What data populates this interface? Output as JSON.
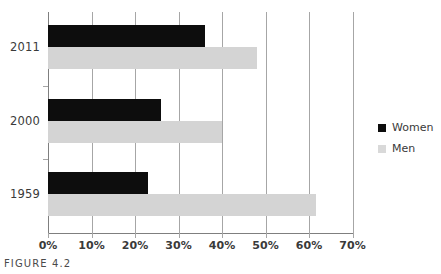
{
  "caption": "FIGURE 4.2",
  "legend": {
    "position": "right",
    "items": [
      {
        "label": "Women",
        "color": "#0d0d0d",
        "swatch": "women-swatch"
      },
      {
        "label": "Men",
        "color": "#d9d9d9",
        "swatch": "men-swatch"
      }
    ]
  },
  "axis": {
    "x_ticks": [
      "0%",
      "10%",
      "20%",
      "30%",
      "40%",
      "50%",
      "60%",
      "70%"
    ],
    "y_ticks": [
      "2011",
      "2000",
      "1959"
    ]
  },
  "chart_data": {
    "type": "bar",
    "orientation": "horizontal",
    "title": "",
    "subtitle": "",
    "xlabel": "",
    "ylabel": "",
    "categories": [
      "2011",
      "2000",
      "1959"
    ],
    "series": [
      {
        "name": "Women",
        "color": "#0d0d0d",
        "values": [
          36,
          26,
          23
        ]
      },
      {
        "name": "Men",
        "color": "#d4d4d4",
        "values": [
          48,
          40,
          61.5
        ]
      }
    ],
    "xlim": [
      0,
      70
    ],
    "xtick_values": [
      0,
      10,
      20,
      30,
      40,
      50,
      60,
      70
    ],
    "xtick_labels": [
      "0%",
      "10%",
      "20%",
      "30%",
      "40%",
      "50%",
      "60%",
      "70%"
    ],
    "unit": "%",
    "grid": "vertical-only",
    "legend_position": "right",
    "category_order_top_to_bottom": [
      "2011",
      "2000",
      "1959"
    ]
  }
}
